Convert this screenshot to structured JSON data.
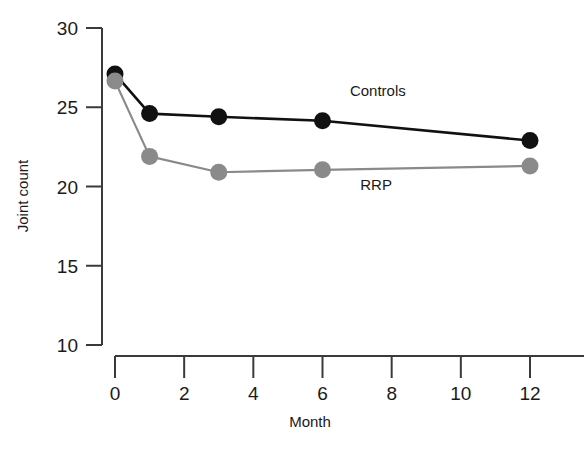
{
  "chart_data": {
    "type": "line",
    "title": "",
    "subtitle": "",
    "xlabel": "Month",
    "ylabel": "Joint count",
    "x": [
      0,
      1,
      3,
      6,
      12
    ],
    "xlim": [
      0,
      12
    ],
    "ylim": [
      10,
      30
    ],
    "xticks": [
      0,
      2,
      4,
      6,
      8,
      10,
      12
    ],
    "xtick_labels": [
      "0",
      "2",
      "4",
      "6",
      "8",
      "10",
      "12"
    ],
    "yticks": [
      10,
      15,
      20,
      25,
      30
    ],
    "ytick_labels": [
      "10",
      "15",
      "20",
      "25",
      "30"
    ],
    "grid": false,
    "legend_position": "inline-annotations",
    "series": [
      {
        "name": "Controls",
        "color": "#111111",
        "marker": "circle",
        "values": [
          27.1,
          24.6,
          24.4,
          24.15,
          22.9
        ],
        "label": "Controls",
        "label_x": 7.6,
        "label_y": 25.7
      },
      {
        "name": "RRP",
        "color": "#8a8a8a",
        "marker": "circle",
        "values": [
          26.65,
          21.9,
          20.9,
          21.05,
          21.3
        ],
        "label": "RRP",
        "label_x": 7.55,
        "label_y": 19.75
      }
    ],
    "annotations": [
      {
        "text": "Controls",
        "series": "Controls"
      },
      {
        "text": "RRP",
        "series": "RRP"
      }
    ]
  },
  "axes": {
    "y_axis_label": "Joint count",
    "x_axis_label": "Month"
  },
  "colors": {
    "controls": "#111111",
    "rrp": "#8a8a8a",
    "axis": "#3a3a3a",
    "background": "#ffffff"
  }
}
